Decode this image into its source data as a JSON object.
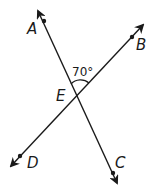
{
  "diagram": {
    "type": "intersecting-lines",
    "lines": [
      {
        "name": "line-AC",
        "through": [
          "A",
          "E",
          "C"
        ]
      },
      {
        "name": "line-DB",
        "through": [
          "D",
          "E",
          "B"
        ]
      }
    ],
    "points": {
      "A": {
        "label": "A"
      },
      "B": {
        "label": "B"
      },
      "C": {
        "label": "C"
      },
      "D": {
        "label": "D"
      },
      "E": {
        "label": "E"
      }
    },
    "angle": {
      "vertex": "E",
      "between": [
        "A",
        "B"
      ],
      "label": "70°"
    },
    "colors": {
      "stroke": "#1a1a1a",
      "background": "#ffffff"
    }
  }
}
